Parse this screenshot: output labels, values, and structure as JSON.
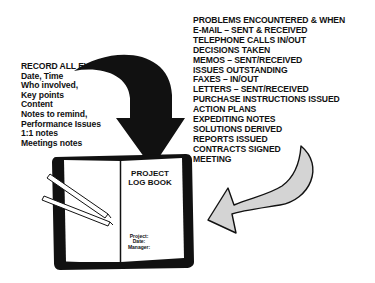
{
  "left_panel": {
    "heading": "RECORD ALL EVENTS:",
    "items": [
      "Date, Time",
      "Who involved,",
      "Key points",
      "Content",
      "Notes to remind,",
      "Performance Issues",
      "1:1 notes",
      "Meetings notes"
    ]
  },
  "right_panel": {
    "items": [
      "PROBLEMS ENCOUNTERED & WHEN",
      "E-MAIL – SENT & RECEIVED",
      "TELEPHONE CALLS  IN/OUT",
      "DECISIONS TAKEN",
      "MEMOS – SENT/RECEIVED",
      "ISSUES OUTSTANDING",
      "FAXES – IN/OUT",
      "LETTERS – SENT/RECEIVED",
      "PURCHASE INSTRUCTIONS ISSUED",
      "ACTION PLANS",
      "EXPEDITING NOTES",
      "SOLUTIONS DERIVED",
      "REPORTS ISSUED",
      "CONTRACTS SIGNED",
      "MEETING"
    ]
  },
  "book": {
    "title_line1": "PROJECT",
    "title_line2": "LOG BOOK",
    "field_project": "Project:",
    "field_date": "Date:",
    "field_manager": "Manager:"
  },
  "colors": {
    "ink": "#111111",
    "grey_arrow_fill": "#d4d4d4",
    "background": "#ffffff"
  }
}
